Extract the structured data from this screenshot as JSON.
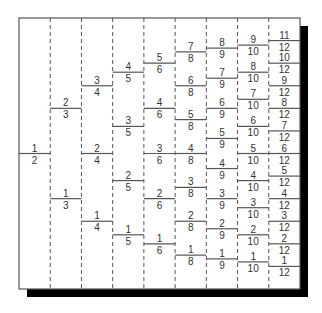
{
  "diagram": {
    "title": "",
    "frame": {
      "left": 19,
      "top": 18,
      "right": 300,
      "bottom": 289,
      "shadow_offset": 8
    },
    "colors": {
      "line": "#555555",
      "text": "#333333",
      "shadow": "#000000",
      "frame": "#555555"
    },
    "columns": [
      {
        "denominator": 2,
        "fractions": [
          "1/2"
        ]
      },
      {
        "denominator": 3,
        "fractions": [
          "1/3",
          "2/3"
        ]
      },
      {
        "denominator": 4,
        "fractions": [
          "1/4",
          "2/4",
          "3/4"
        ]
      },
      {
        "denominator": 5,
        "fractions": [
          "1/5",
          "2/5",
          "3/5",
          "4/5"
        ]
      },
      {
        "denominator": 6,
        "fractions": [
          "1/6",
          "2/6",
          "3/6",
          "4/6",
          "5/6"
        ]
      },
      {
        "denominator": 8,
        "fractions": [
          "1/8",
          "2/8",
          "3/8",
          "4/8",
          "5/8",
          "6/8",
          "7/8"
        ]
      },
      {
        "denominator": 9,
        "fractions": [
          "1/9",
          "2/9",
          "3/9",
          "4/9",
          "5/9",
          "6/9",
          "7/9",
          "8/9"
        ]
      },
      {
        "denominator": 10,
        "fractions": [
          "1/10",
          "2/10",
          "3/10",
          "4/10",
          "5/10",
          "6/10",
          "7/10",
          "8/10",
          "9/10"
        ]
      },
      {
        "denominator": 12,
        "fractions": [
          "1/12",
          "2/12",
          "3/12",
          "4/12",
          "5/12",
          "6/12",
          "7/12",
          "8/12",
          "9/12",
          "10/12",
          "11/12"
        ]
      }
    ]
  }
}
